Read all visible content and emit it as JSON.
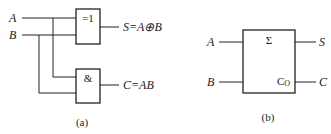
{
  "figure_a": {
    "inputs": [
      "A",
      "B"
    ],
    "xor_gate": {
      "symbol": "=1",
      "output_label": "S=A⊕B"
    },
    "and_gate": {
      "symbol": "&",
      "output_label": "C=AB"
    },
    "caption": "(a)"
  },
  "figure_b": {
    "inputs": [
      "A",
      "B"
    ],
    "block": {
      "sum_symbol": "Σ",
      "carry_symbol": "C",
      "carry_subscript": "O"
    },
    "outputs": [
      "S",
      "C"
    ],
    "caption": "(b)"
  }
}
